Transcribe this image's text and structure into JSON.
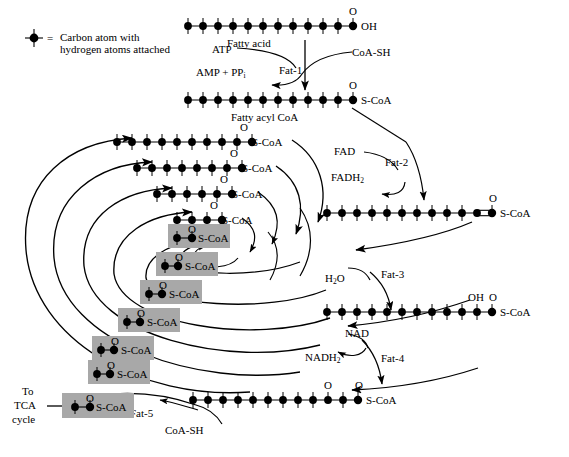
{
  "diagram": {
    "legend": {
      "symbol": "carbon-atom-dot",
      "equals": "=",
      "line1": "Carbon atom with",
      "line2": "hydrogen atoms attached"
    },
    "colors": {
      "stroke": "#000000",
      "background": "#ffffff",
      "highlight": "#a8a8a8"
    },
    "molecules": [
      {
        "id": "fatty-acid",
        "label": "Fatty acid",
        "carbons": 12,
        "terminal": "OH",
        "oxygens": [
          "C1"
        ],
        "doubleBond": null,
        "highlight": false
      },
      {
        "id": "fatty-acyl-coa",
        "label": "Fatty acyl CoA",
        "carbons": 12,
        "terminal": "S-CoA",
        "oxygens": [
          "C1"
        ],
        "doubleBond": null,
        "highlight": false
      },
      {
        "id": "enoyl-coa",
        "label": "",
        "carbons": 12,
        "terminal": "S-CoA",
        "oxygens": [
          "C1"
        ],
        "doubleBond": "C2=C3",
        "highlight": false
      },
      {
        "id": "hydroxyacyl-coa",
        "label": "",
        "carbons": 12,
        "terminal": "S-CoA",
        "oxygens": [
          "C1"
        ],
        "hydroxyl": "C3",
        "doubleBond": null,
        "highlight": false
      },
      {
        "id": "ketoacyl-coa",
        "label": "",
        "carbons": 12,
        "terminal": "S-CoA",
        "oxygens": [
          "C1",
          "C3"
        ],
        "doubleBond": null,
        "highlight": false
      },
      {
        "id": "acyl-coa-10",
        "label": "",
        "carbons": 10,
        "terminal": "S-CoA",
        "oxygens": [
          "C1"
        ],
        "highlight": false
      },
      {
        "id": "acyl-coa-8",
        "label": "",
        "carbons": 8,
        "terminal": "S-CoA",
        "oxygens": [
          "C1"
        ],
        "highlight": false
      },
      {
        "id": "acyl-coa-6",
        "label": "",
        "carbons": 6,
        "terminal": "S-CoA",
        "oxygens": [
          "C1"
        ],
        "highlight": false
      },
      {
        "id": "acyl-coa-4",
        "label": "",
        "carbons": 4,
        "terminal": "S-CoA",
        "oxygens": [
          "C1"
        ],
        "highlight": false
      },
      {
        "id": "acetyl-coa-1",
        "label": "",
        "carbons": 2,
        "terminal": "S-CoA",
        "oxygens": [
          "C1"
        ],
        "highlight": true
      },
      {
        "id": "acetyl-coa-2",
        "label": "",
        "carbons": 2,
        "terminal": "S-CoA",
        "oxygens": [
          "C1"
        ],
        "highlight": true
      },
      {
        "id": "acetyl-coa-3",
        "label": "",
        "carbons": 2,
        "terminal": "S-CoA",
        "oxygens": [
          "C1"
        ],
        "highlight": true
      },
      {
        "id": "acetyl-coa-4",
        "label": "",
        "carbons": 2,
        "terminal": "S-CoA",
        "oxygens": [
          "C1"
        ],
        "highlight": true
      },
      {
        "id": "acetyl-coa-5",
        "label": "",
        "carbons": 2,
        "terminal": "S-CoA",
        "oxygens": [
          "C1"
        ],
        "highlight": true
      },
      {
        "id": "acetyl-coa-final",
        "label": "Acetyl CoA",
        "carbons": 2,
        "terminal": "S-CoA",
        "oxygens": [
          "C1"
        ],
        "highlight": true
      }
    ],
    "enzymes": [
      {
        "id": "fat-1",
        "label": "Fat-1"
      },
      {
        "id": "fat-2",
        "label": "Fat-2"
      },
      {
        "id": "fat-3",
        "label": "Fat-3"
      },
      {
        "id": "fat-4",
        "label": "Fat-4"
      },
      {
        "id": "fat-5",
        "label": "Fat-5"
      }
    ],
    "cofactors": {
      "atp": "ATP",
      "amp_ppi_pre": "AMP  +  PP",
      "amp_ppi_sub": "i",
      "coash_top": "CoA-SH",
      "coash_bottom": "CoA-SH",
      "fad": "FAD",
      "fadh2_pre": "FADH",
      "fadh2_sub": "2",
      "water_pre": "H",
      "water_sub": "2",
      "water_post": "O",
      "nad": "NAD",
      "nadh2_pre": "NADH",
      "nadh2_sub": "2"
    },
    "groups": {
      "O": "O",
      "OH": "OH",
      "SCOA": "S-CoA"
    },
    "output": {
      "line1": "To",
      "line2": "TCA",
      "line3": "cycle"
    }
  }
}
